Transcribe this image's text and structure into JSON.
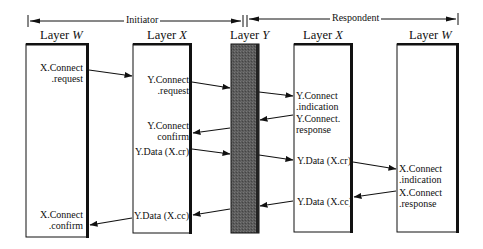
{
  "header": {
    "initiator": "Initiator",
    "respondent": "Respondent"
  },
  "layers": [
    {
      "id": "w-left",
      "prefix": "Layer",
      "name": "W"
    },
    {
      "id": "x-left",
      "prefix": "Layer",
      "name": "X"
    },
    {
      "id": "y",
      "prefix": "Layer",
      "name": "Y"
    },
    {
      "id": "x-right",
      "prefix": "Layer",
      "name": "X"
    },
    {
      "id": "w-right",
      "prefix": "Layer",
      "name": "W"
    }
  ],
  "primitives": {
    "w_left": {
      "x_connect_request": [
        "X.Connect",
        ".request"
      ],
      "x_connect_confirm": [
        "X.Connect",
        ".confirm"
      ]
    },
    "x_left": {
      "y_connect_request": [
        "Y.Connect",
        ".request"
      ],
      "y_connect_confirm": [
        "Y.Connect",
        "confirm"
      ],
      "y_data_cr": "Y.Data (X.cr)",
      "y_data_cc": "Y.Data (X.cc)"
    },
    "x_right": {
      "y_connect_indication": [
        "Y.Connect",
        ".indication"
      ],
      "y_connect_response": [
        "Y.Connect.",
        "response"
      ],
      "y_data_cr": "Y.Data (X.cr)",
      "y_data_cc": "Y.Data (X.cc)"
    },
    "w_right": {
      "x_connect_indication": [
        "X.Connect",
        ".indication"
      ],
      "x_connect_response": [
        "X.Connect",
        ".response"
      ]
    }
  },
  "colors": {
    "line": "#111111",
    "layer_y_fill": "#5a5a5a",
    "box_fill": "#ffffff"
  }
}
